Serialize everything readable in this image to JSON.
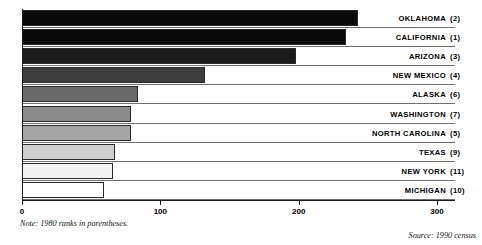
{
  "chart_data": {
    "type": "bar",
    "orientation": "horizontal",
    "title": "",
    "xlabel": "",
    "ylabel": "",
    "xlim": [
      0,
      313
    ],
    "xticks": [
      0,
      100,
      200,
      300
    ],
    "xtick_labels": [
      "0",
      "100",
      "200",
      "300"
    ],
    "grid": false,
    "legend": false,
    "categories": [
      "OKLAHOMA",
      "CALIFORNIA",
      "ARIZONA",
      "NEW MEXICO",
      "ALASKA",
      "WASHINGTON",
      "NORTH CAROLINA",
      "TEXAS",
      "NEW YORK",
      "MICHIGAN"
    ],
    "values": [
      243,
      234,
      198,
      132,
      84,
      79,
      79,
      67,
      66,
      59
    ],
    "ranks": [
      "(2)",
      "(1)",
      "(3)",
      "(4)",
      "(6)",
      "(7)",
      "(5)",
      "(9)",
      "(11)",
      "(10)"
    ],
    "bar_colors": [
      "#0a0a0a",
      "#0a0a0a",
      "#1c1c1c",
      "#3d3d3d",
      "#6a6a6a",
      "#8a8a8a",
      "#a5a5a5",
      "#d0d0d0",
      "#f2f2f2",
      "#ffffff"
    ],
    "annotations": {
      "note": "Note: 1980 ranks in parentheses.",
      "source": "Source: 1990 census"
    }
  }
}
